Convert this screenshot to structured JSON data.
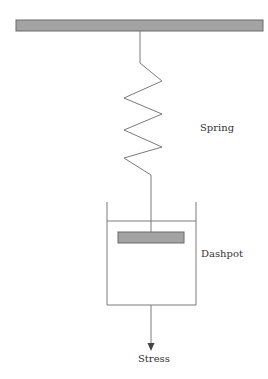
{
  "diagram": {
    "labels": {
      "spring": "Spring",
      "dashpot": "Dashpot",
      "stress": "Stress"
    },
    "colors": {
      "line": "#6a6a6a",
      "fill": "#a3a3a3",
      "text": "#333333"
    },
    "components": [
      {
        "id": "fixed-support",
        "type": "wall"
      },
      {
        "id": "spring",
        "type": "spring"
      },
      {
        "id": "dashpot",
        "type": "dashpot"
      },
      {
        "id": "stress-arrow",
        "type": "arrow",
        "direction": "down"
      }
    ]
  }
}
